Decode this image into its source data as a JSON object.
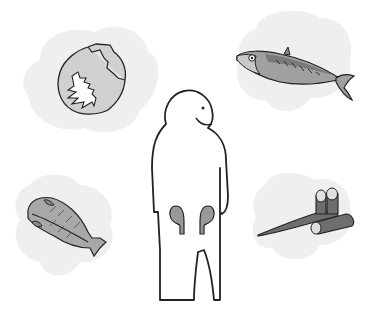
{
  "illustration": {
    "subject": "person-with-kidneys",
    "foods": [
      {
        "name": "cabbage"
      },
      {
        "name": "mackerel"
      },
      {
        "name": "dried-fish"
      },
      {
        "name": "burdock-root"
      }
    ]
  },
  "colors": {
    "background": "#ffffff",
    "cloud": "#eeeeee",
    "outline": "#222222",
    "fill_mid": "#a8a8a8",
    "fill_dark": "#777777",
    "kidney": "#9a9a9a"
  }
}
